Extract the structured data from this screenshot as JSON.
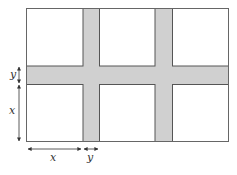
{
  "diagram": {
    "colors": {
      "path_fill": "#d0d0d0",
      "square_fill": "#ffffff",
      "outline": "#555555",
      "arrow": "#333333"
    },
    "frame": {
      "x": 26,
      "y": 8,
      "w": 203,
      "h": 134
    },
    "vertical_paths": [
      {
        "x": 83,
        "w": 16
      },
      {
        "x": 155,
        "w": 17
      }
    ],
    "horizontal_path": {
      "y": 66,
      "h": 18
    },
    "labels": {
      "left_small": "y",
      "left_large": "x",
      "bottom_large": "x",
      "bottom_small": "y"
    }
  }
}
